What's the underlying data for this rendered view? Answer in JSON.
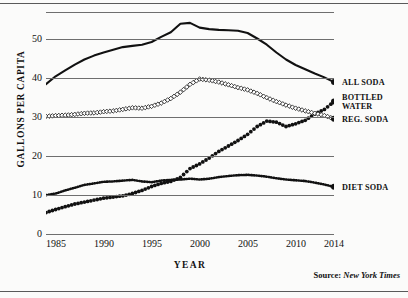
{
  "chart_data": {
    "type": "line",
    "title": "",
    "xlabel": "YEAR",
    "ylabel": "GALLONS PER CAPITA",
    "xlim": [
      1984,
      2014
    ],
    "ylim": [
      0,
      57
    ],
    "grid": true,
    "legend_position": "right",
    "yticks": [
      0,
      10,
      20,
      30,
      40,
      50
    ],
    "xticks": [
      1985,
      1990,
      1995,
      2000,
      2005,
      2010,
      2014
    ],
    "x": [
      1984,
      1985,
      1986,
      1987,
      1988,
      1989,
      1990,
      1991,
      1992,
      1993,
      1994,
      1995,
      1996,
      1997,
      1998,
      1999,
      2000,
      2001,
      2002,
      2003,
      2004,
      2005,
      2006,
      2007,
      2008,
      2009,
      2010,
      2011,
      2012,
      2013,
      2014
    ],
    "series": [
      {
        "name": "ALL SODA",
        "marker": "solid-line",
        "values": [
          38.5,
          40.5,
          42.0,
          43.5,
          44.8,
          45.8,
          46.6,
          47.3,
          48.0,
          48.3,
          48.6,
          49.3,
          50.6,
          51.8,
          54.0,
          54.2,
          53.0,
          52.6,
          52.4,
          52.3,
          52.2,
          51.6,
          50.2,
          48.6,
          46.6,
          44.8,
          43.4,
          42.3,
          41.2,
          40.2,
          39.0
        ]
      },
      {
        "name": "BOTTLED WATER",
        "marker": "filled-dot",
        "values": [
          5.5,
          6.3,
          7.0,
          7.7,
          8.2,
          8.7,
          9.2,
          9.5,
          9.8,
          10.4,
          11.2,
          12.2,
          13.0,
          13.5,
          14.5,
          16.8,
          18.0,
          19.5,
          21.2,
          22.6,
          24.0,
          25.6,
          27.6,
          29.0,
          28.7,
          27.6,
          28.3,
          29.2,
          30.8,
          32.0,
          34.0
        ]
      },
      {
        "name": "REG. SODA",
        "marker": "open-diamond",
        "values": [
          30.2,
          30.4,
          30.5,
          30.7,
          31.0,
          31.1,
          31.4,
          31.6,
          32.0,
          32.4,
          32.3,
          32.8,
          33.6,
          34.8,
          36.4,
          38.4,
          39.8,
          39.5,
          39.0,
          38.3,
          37.6,
          37.0,
          36.1,
          35.0,
          34.0,
          33.1,
          32.3,
          31.6,
          31.0,
          30.4,
          29.6
        ]
      },
      {
        "name": "DIET SODA",
        "marker": "medium-dot-line",
        "values": [
          10.0,
          10.4,
          11.2,
          11.9,
          12.6,
          13.0,
          13.4,
          13.5,
          13.7,
          13.9,
          13.5,
          13.3,
          13.7,
          13.9,
          14.0,
          14.2,
          14.0,
          14.2,
          14.6,
          14.9,
          15.1,
          15.2,
          15.0,
          14.7,
          14.3,
          14.0,
          13.8,
          13.6,
          13.2,
          12.7,
          12.1
        ]
      }
    ]
  },
  "legend": {
    "items": [
      {
        "label": "ALL SODA",
        "key": "all-soda"
      },
      {
        "label": "BOTTLED WATER",
        "key": "bottled-water"
      },
      {
        "label": "REG. SODA",
        "key": "reg-soda"
      },
      {
        "label": "DIET SODA",
        "key": "diet-soda"
      }
    ]
  },
  "source": {
    "prefix": "Source:",
    "publication": "New York Times"
  },
  "colors": {
    "ink": "#111111",
    "gridline": "#6e6e6e",
    "background": "#fbfbfa"
  }
}
